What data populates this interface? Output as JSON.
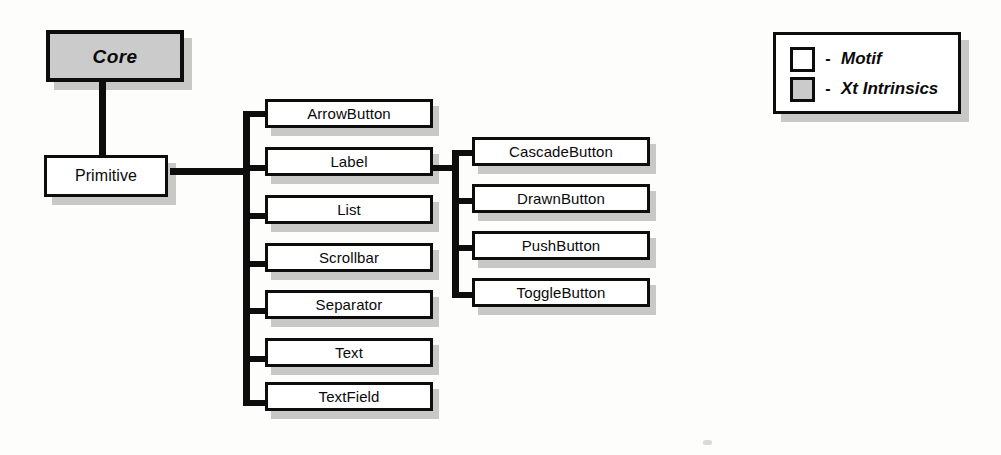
{
  "diagram": {
    "background_color": "#fdfdfb",
    "line_color": "#0d0d0d",
    "fill_motif": "#ffffff",
    "fill_xt_intrinsics": "#cbcbcb",
    "shadow_color": "#b9b9b9"
  },
  "nodes": {
    "root": {
      "label": "Core",
      "kind": "xt-intrinsics"
    },
    "primitive": {
      "label": "Primitive",
      "kind": "motif"
    },
    "primitive_children": [
      {
        "label": "ArrowButton",
        "kind": "motif"
      },
      {
        "label": "Label",
        "kind": "motif"
      },
      {
        "label": "List",
        "kind": "motif"
      },
      {
        "label": "Scrollbar",
        "kind": "motif"
      },
      {
        "label": "Separator",
        "kind": "motif"
      },
      {
        "label": "Text",
        "kind": "motif"
      },
      {
        "label": "TextField",
        "kind": "motif"
      }
    ],
    "label_children": [
      {
        "label": "CascadeButton",
        "kind": "motif"
      },
      {
        "label": "DrawnButton",
        "kind": "motif"
      },
      {
        "label": "PushButton",
        "kind": "motif"
      },
      {
        "label": "ToggleButton",
        "kind": "motif"
      }
    ]
  },
  "legend": {
    "items": [
      {
        "swatch": "white-square",
        "dash": "-",
        "text": "Motif"
      },
      {
        "swatch": "gray-square",
        "dash": "-",
        "text": "Xt Intrinsics"
      }
    ]
  }
}
